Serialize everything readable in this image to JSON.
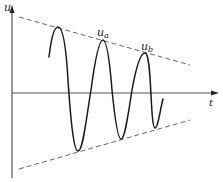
{
  "diagram": {
    "axes": {
      "y_label": "u",
      "x_label": "t"
    },
    "annotations": [
      {
        "id": "ua",
        "base": "u",
        "sub": "a"
      },
      {
        "id": "ub",
        "base": "u",
        "sub": "b"
      }
    ],
    "colors": {
      "curve": "#1a1a1a",
      "axis": "#333333",
      "envelope": "#555555",
      "background": "#ffffff"
    }
  }
}
